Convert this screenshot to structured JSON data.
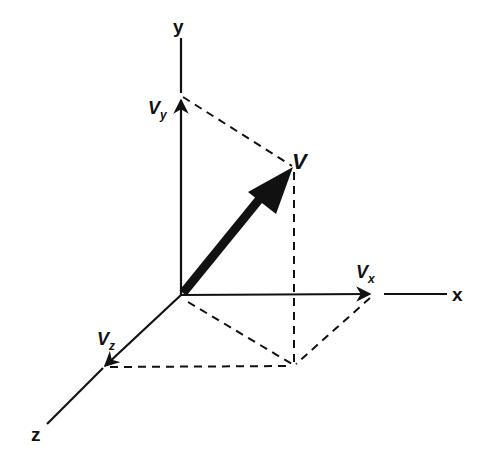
{
  "diagram": {
    "title": "",
    "type": "3D vector components",
    "axes": {
      "x": {
        "label": "x"
      },
      "y": {
        "label": "y"
      },
      "z": {
        "label": "z"
      }
    },
    "vector": {
      "label": "V"
    },
    "components": {
      "vx": {
        "main": "V",
        "sub": "x"
      },
      "vy": {
        "main": "V",
        "sub": "y"
      },
      "vz": {
        "main": "V",
        "sub": "z"
      }
    },
    "colors": {
      "ink": "#111111",
      "background": "#ffffff"
    }
  }
}
